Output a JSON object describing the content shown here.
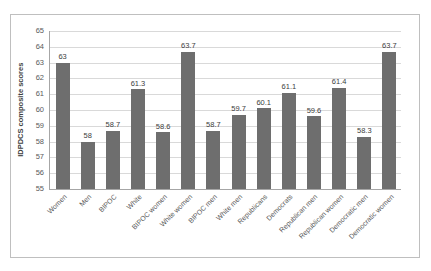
{
  "chart_data": {
    "type": "bar",
    "title": "",
    "xlabel": "",
    "ylabel": "IDPDCS composite scores",
    "ylim": [
      55,
      65
    ],
    "ytick_labels": [
      "65",
      "64",
      "63",
      "62",
      "61",
      "60",
      "59",
      "58",
      "57",
      "56",
      "55"
    ],
    "yticks": [
      65,
      64,
      63,
      62,
      61,
      60,
      59,
      58,
      57,
      56,
      55
    ],
    "grid": true,
    "legend": "none",
    "bar_color": "#6e6e6e",
    "gridline_color": "#d9d9d9",
    "categories": [
      "Women",
      "Men",
      "BIPOC",
      "White",
      "BIPOC women",
      "White women",
      "BIPOC men",
      "White men",
      "Republicans",
      "Democrats",
      "Republican men",
      "Republican women",
      "Democratic men",
      "Democratic women"
    ],
    "values": [
      63,
      58,
      58.7,
      61.3,
      58.6,
      63.7,
      58.7,
      59.7,
      60.1,
      61.1,
      59.6,
      61.4,
      58.3,
      63.7
    ],
    "value_labels": [
      "63",
      "58",
      "58.7",
      "61.3",
      "58.6",
      "63.7",
      "58.7",
      "59.7",
      "60.1",
      "61.1",
      "59.6",
      "61.4",
      "58.3",
      "63.7"
    ]
  }
}
